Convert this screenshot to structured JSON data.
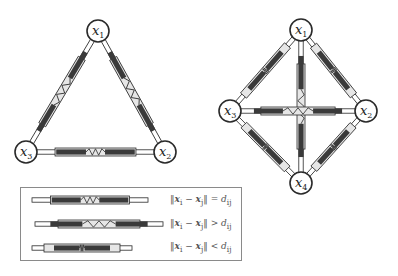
{
  "figure": {
    "triangle_graph": {
      "nodes": [
        {
          "id": "x1",
          "label": "x",
          "sub": "1",
          "cx": 98,
          "cy": 31
        },
        {
          "id": "x2",
          "label": "x",
          "sub": "2",
          "cx": 165,
          "cy": 152
        },
        {
          "id": "x3",
          "label": "x",
          "sub": "3",
          "cx": 26,
          "cy": 152
        }
      ],
      "edges": [
        {
          "from": "x1",
          "to": "x3",
          "state": "stretched"
        },
        {
          "from": "x1",
          "to": "x2",
          "state": "stretched"
        },
        {
          "from": "x3",
          "to": "x2",
          "state": "rest"
        }
      ]
    },
    "diamond_graph": {
      "nodes": [
        {
          "id": "x1",
          "label": "x",
          "sub": "1",
          "cx": 301,
          "cy": 30
        },
        {
          "id": "x2",
          "label": "x",
          "sub": "2",
          "cx": 366,
          "cy": 111
        },
        {
          "id": "x3",
          "label": "x",
          "sub": "3",
          "cx": 230,
          "cy": 111
        },
        {
          "id": "x4",
          "label": "x",
          "sub": "4",
          "cx": 301,
          "cy": 183
        }
      ],
      "edges": [
        {
          "from": "x1",
          "to": "x3",
          "state": "compressed"
        },
        {
          "from": "x1",
          "to": "x2",
          "state": "compressed"
        },
        {
          "from": "x3",
          "to": "x4",
          "state": "compressed"
        },
        {
          "from": "x2",
          "to": "x4",
          "state": "compressed"
        },
        {
          "from": "x1",
          "to": "x4",
          "state": "stretched"
        },
        {
          "from": "x3",
          "to": "x2",
          "state": "stretched"
        }
      ]
    },
    "legend": {
      "entries": [
        {
          "state": "rest",
          "lhs": "‖x_i − x_j‖",
          "op": "=",
          "rhs": "d_ij",
          "text_i": "i",
          "text_j": "j",
          "op_symbol": "="
        },
        {
          "state": "stretched",
          "lhs": "‖x_i − x_j‖",
          "op": ">",
          "rhs": "d_ij",
          "text_i": "i",
          "text_j": "j",
          "op_symbol": ">"
        },
        {
          "state": "compressed",
          "lhs": "‖x_i − x_j‖",
          "op": "<",
          "rhs": "d_ij",
          "text_i": "i",
          "text_j": "j",
          "op_symbol": "<"
        }
      ]
    },
    "colors": {
      "stroke": "#2a2a2a",
      "rod_fill": "#ffffff",
      "sleeve_fill": "#e6e6e6",
      "core_fill": "#3a3a3a",
      "legend_border": "#8a8a8a"
    }
  }
}
